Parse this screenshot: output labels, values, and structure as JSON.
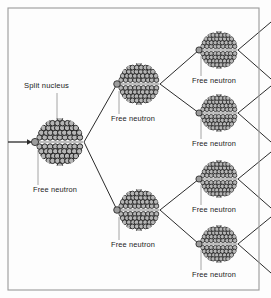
{
  "figure": {
    "background_color": "#fdfdfd",
    "frame_color": "#9a9a9a",
    "line_color": "#2b2b2b",
    "nucleon_fill": "#b5b5b5",
    "nucleon_stroke": "#1c1c1c",
    "neutron_fill": "#9c9c9c",
    "leader_color": "#8d8d8d"
  },
  "labels": {
    "split_nucleus": "Split nucleus",
    "free_neutron": "Free neutron"
  },
  "frame": {
    "x": 8,
    "y": 8,
    "width": 251,
    "height": 282
  },
  "incoming_arrow": {
    "x1": 8,
    "y1": 142,
    "x2": 32,
    "y2": 142
  },
  "nuclei": [
    {
      "id": "gen0-nucleus",
      "cx": 60,
      "cy": 142,
      "r": 24,
      "generation": 0,
      "neutron": {
        "cx": 35,
        "cy": 142,
        "r": 3.6
      },
      "label": "Free neutron",
      "label_x": 33,
      "label_y": 192,
      "leader": {
        "x1": 38,
        "y1": 150,
        "x2": 38,
        "y2": 185
      },
      "title_label": "Split nucleus",
      "title_x": 24,
      "title_y": 88,
      "title_leader": {
        "x1": 57,
        "y1": 93,
        "x2": 57,
        "y2": 120
      }
    },
    {
      "id": "gen1-nucleus-top",
      "cx": 139,
      "cy": 84,
      "r": 21,
      "generation": 1,
      "neutron": {
        "cx": 117,
        "cy": 84,
        "r": 3.3
      },
      "label": "Free neutron",
      "label_x": 111,
      "label_y": 121,
      "leader": {
        "x1": 119,
        "y1": 91,
        "x2": 119,
        "y2": 114
      }
    },
    {
      "id": "gen1-nucleus-bottom",
      "cx": 139,
      "cy": 210,
      "r": 21,
      "generation": 1,
      "neutron": {
        "cx": 117,
        "cy": 210,
        "r": 3.3
      },
      "label": "Free neutron",
      "label_x": 111,
      "label_y": 247,
      "leader": {
        "x1": 119,
        "y1": 217,
        "x2": 119,
        "y2": 240
      }
    },
    {
      "id": "gen2-nucleus-1",
      "cx": 219,
      "cy": 50,
      "r": 19,
      "generation": 2,
      "neutron": {
        "cx": 199,
        "cy": 50,
        "r": 3.1
      },
      "label": "Free neutron",
      "label_x": 192,
      "label_y": 83,
      "leader": {
        "x1": 201,
        "y1": 56,
        "x2": 201,
        "y2": 76
      }
    },
    {
      "id": "gen2-nucleus-2",
      "cx": 219,
      "cy": 113,
      "r": 19,
      "generation": 2,
      "neutron": {
        "cx": 199,
        "cy": 113,
        "r": 3.1
      },
      "label": "Free neutron",
      "label_x": 192,
      "label_y": 146,
      "leader": {
        "x1": 201,
        "y1": 119,
        "x2": 201,
        "y2": 139
      }
    },
    {
      "id": "gen2-nucleus-3",
      "cx": 219,
      "cy": 179,
      "r": 19,
      "generation": 2,
      "neutron": {
        "cx": 199,
        "cy": 179,
        "r": 3.1
      },
      "label": "Free neutron",
      "label_x": 192,
      "label_y": 212,
      "leader": {
        "x1": 201,
        "y1": 185,
        "x2": 201,
        "y2": 205
      }
    },
    {
      "id": "gen2-nucleus-4",
      "cx": 219,
      "cy": 244,
      "r": 19,
      "generation": 2,
      "neutron": {
        "cx": 199,
        "cy": 244,
        "r": 3.1
      },
      "label": "Free neutron",
      "label_x": 192,
      "label_y": 277,
      "leader": {
        "x1": 201,
        "y1": 250,
        "x2": 201,
        "y2": 270
      }
    }
  ],
  "branches": [
    {
      "from": "gen0-nucleus",
      "x1": 84,
      "y1": 142,
      "x2": 117,
      "y2": 84
    },
    {
      "from": "gen0-nucleus",
      "x1": 84,
      "y1": 142,
      "x2": 117,
      "y2": 210
    },
    {
      "from": "gen1-nucleus-top",
      "x1": 160,
      "y1": 84,
      "x2": 199,
      "y2": 50
    },
    {
      "from": "gen1-nucleus-top",
      "x1": 160,
      "y1": 84,
      "x2": 199,
      "y2": 113
    },
    {
      "from": "gen1-nucleus-bottom",
      "x1": 160,
      "y1": 210,
      "x2": 199,
      "y2": 179
    },
    {
      "from": "gen1-nucleus-bottom",
      "x1": 160,
      "y1": 210,
      "x2": 199,
      "y2": 244
    },
    {
      "from": "gen2-nucleus-1",
      "x1": 238,
      "y1": 50,
      "x2": 271,
      "y2": 22
    },
    {
      "from": "gen2-nucleus-1",
      "x1": 238,
      "y1": 50,
      "x2": 271,
      "y2": 79
    },
    {
      "from": "gen2-nucleus-2",
      "x1": 238,
      "y1": 113,
      "x2": 271,
      "y2": 86
    },
    {
      "from": "gen2-nucleus-2",
      "x1": 238,
      "y1": 113,
      "x2": 271,
      "y2": 142
    },
    {
      "from": "gen2-nucleus-3",
      "x1": 238,
      "y1": 179,
      "x2": 271,
      "y2": 152
    },
    {
      "from": "gen2-nucleus-3",
      "x1": 238,
      "y1": 179,
      "x2": 271,
      "y2": 208
    },
    {
      "from": "gen2-nucleus-4",
      "x1": 238,
      "y1": 244,
      "x2": 271,
      "y2": 217
    },
    {
      "from": "gen2-nucleus-4",
      "x1": 238,
      "y1": 244,
      "x2": 271,
      "y2": 273
    }
  ]
}
